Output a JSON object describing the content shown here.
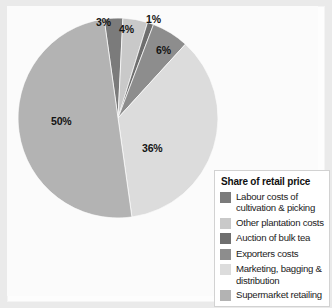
{
  "chart_data": {
    "type": "pie",
    "title": "",
    "legend_title": "Share of retail price",
    "legend_position": "bottom-right",
    "categories": [
      "Labour costs of cultivation & picking",
      "Other plantation costs",
      "Auction of bulk tea",
      "Exporters costs",
      "Marketing, bagging & distribution",
      "Supermarket retailing"
    ],
    "values": [
      3,
      4,
      1,
      6,
      36,
      50
    ],
    "value_labels": [
      "3%",
      "4%",
      "1%",
      "6%",
      "36%",
      "50%"
    ],
    "units": "percent",
    "total": 100,
    "colors": [
      "#7b7b7b",
      "#c9c9c9",
      "#6e6e6e",
      "#8d8d8d",
      "#dcdcdc",
      "#b3b3b3"
    ],
    "start_angle_deg": -8,
    "direction": "clockwise"
  },
  "legend": {
    "title": "Share of retail price",
    "items": [
      {
        "label": "Labour costs of cultivation & picking",
        "color": "#7b7b7b",
        "value": "3%"
      },
      {
        "label": "Other plantation costs",
        "color": "#c9c9c9",
        "value": "4%"
      },
      {
        "label": "Auction of bulk tea",
        "color": "#6e6e6e",
        "value": "1%"
      },
      {
        "label": "Exporters costs",
        "color": "#8d8d8d",
        "value": "6%"
      },
      {
        "label": "Marketing, bagging & distribution",
        "color": "#dcdcdc",
        "value": "36%"
      },
      {
        "label": "Supermarket retailing",
        "color": "#b3b3b3",
        "value": "50%"
      }
    ]
  },
  "labels": {
    "l0": "3%",
    "l1": "4%",
    "l2": "1%",
    "l3": "6%",
    "l4": "36%",
    "l5": "50%"
  }
}
